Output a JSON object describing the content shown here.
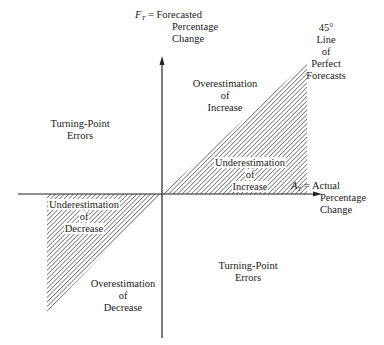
{
  "diagram": {
    "type": "forecast-error-quadrant-diagram",
    "y_axis": {
      "symbol": "F",
      "subscript": "T",
      "label_line1": " = Forecasted",
      "label_line2": "Percentage",
      "label_line3": "Change"
    },
    "x_axis": {
      "symbol": "A",
      "subscript": "T",
      "label_line1": " = Actual",
      "label_line2": "Percentage",
      "label_line3": "Change"
    },
    "perfect_line": {
      "line1": "45°",
      "line2": "Line",
      "line3": "of",
      "line4": "Perfect",
      "line5": "Forecasts"
    },
    "regions": {
      "overestimation_increase": [
        "Overestimation",
        "of",
        "Increase"
      ],
      "underestimation_increase": [
        "Underestimation",
        "of",
        "Increase"
      ],
      "underestimation_decrease": [
        "Underestimation",
        "of",
        "Decrease"
      ],
      "overestimation_decrease": [
        "Overestimation",
        "of",
        "Decrease"
      ],
      "turning_point_upper_left": [
        "Turning-Point",
        "Errors"
      ],
      "turning_point_lower_right": [
        "Turning-Point",
        "Errors"
      ]
    },
    "colors": {
      "line": "#222222",
      "hatch": "#333333",
      "background": "#ffffff"
    }
  }
}
